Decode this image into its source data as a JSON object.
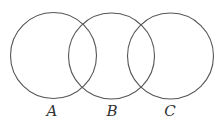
{
  "diagram": {
    "type": "venn-three-circles-chain",
    "stroke_color": "#555555",
    "circles": [
      {
        "id": "A",
        "label": "A",
        "cx": 53.5,
        "cy": 55.5,
        "r": 43
      },
      {
        "id": "B",
        "label": "B",
        "cx": 111.5,
        "cy": 56,
        "r": 43
      },
      {
        "id": "C",
        "label": "C",
        "cx": 170.5,
        "cy": 56,
        "r": 43
      }
    ],
    "labels": {
      "a": "A",
      "b": "B",
      "c": "C"
    }
  }
}
